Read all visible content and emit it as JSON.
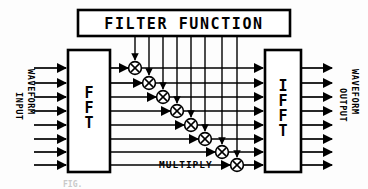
{
  "diagram": {
    "title_box": {
      "label": "FILTER FUNCTION"
    },
    "blocks": [
      {
        "id": "fft",
        "label": "FFT",
        "letters": [
          "F",
          "F",
          "T"
        ]
      },
      {
        "id": "ifft",
        "label": "IFFT",
        "letters": [
          "I",
          "F",
          "F",
          "T"
        ]
      }
    ],
    "left_labels": {
      "primary": "INPUT",
      "secondary": "WAVEFORM"
    },
    "right_labels": {
      "primary": "OUTPUT",
      "secondary": "WAVEFORM"
    },
    "multiply_label": "MULTIPLY",
    "caption": "FIG.",
    "channel_count": 8,
    "multiplier_symbol": "X",
    "colors": {
      "stroke": "#000000",
      "fill": "#ffffff",
      "background": "#fdfdfd"
    }
  },
  "geometry": {
    "width": 368,
    "height": 189,
    "rows_y": [
      68,
      83,
      97,
      111,
      125,
      139,
      152,
      165
    ],
    "mult_x": [
      135,
      149,
      163,
      177,
      191,
      205,
      222,
      237
    ],
    "drop_x": [
      135,
      149,
      163,
      177,
      191,
      205,
      222,
      237
    ],
    "fft_box": {
      "x": 68,
      "y": 50,
      "w": 42,
      "h": 122
    },
    "ifft_box": {
      "x": 265,
      "y": 50,
      "w": 36,
      "h": 122
    },
    "title_box": {
      "x": 78,
      "y": 10,
      "w": 212,
      "h": 26
    }
  }
}
